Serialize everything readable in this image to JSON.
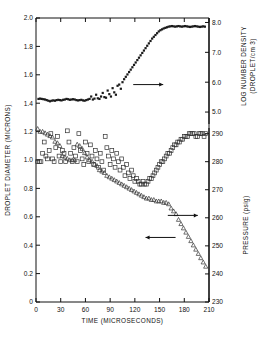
{
  "figure": {
    "background": "#ffffff",
    "ink": "#111111"
  },
  "chart_data": {
    "type": "scatter",
    "title": "",
    "xlabel": "TIME (MICROSECONDS)",
    "xlim": [
      0,
      210
    ],
    "xticks": [
      0,
      30,
      60,
      90,
      120,
      150,
      180,
      210
    ],
    "xticklabels": [
      "0",
      "30",
      "60",
      "90",
      "120",
      "150",
      "180",
      "210"
    ],
    "axes": [
      {
        "id": "left",
        "label": "DROPLET DIAMETER (MICRONS)",
        "lim": [
          0,
          2.0
        ],
        "ticks": [
          0,
          0.2,
          0.4,
          0.6,
          0.8,
          1.0,
          1.2,
          1.4,
          1.6,
          1.8,
          2.0
        ],
        "ticklabels": [
          "0",
          "0.2",
          "0.4",
          "0.6",
          "0.8",
          "1.0",
          "1.2",
          "1.4",
          "1.6",
          "1.8",
          "2.0"
        ]
      },
      {
        "id": "right-top",
        "label": "LOG NUMBER DENSITY",
        "label2": "(DROPLET/cm 3)",
        "lim": [
          4.6,
          8.15
        ],
        "ticks": [
          5.0,
          6.0,
          7.0,
          8.0
        ],
        "ticklabels": [
          "5.0",
          "6.0",
          "7.0",
          "8.0"
        ]
      },
      {
        "id": "right-bottom",
        "label": "PRESSURE (psig)",
        "lim": [
          230,
          292
        ],
        "ticks": [
          230,
          240,
          250,
          260,
          270,
          280,
          290
        ],
        "ticklabels": [
          "230",
          "240",
          "250",
          "260",
          "270",
          "280",
          "290"
        ]
      }
    ],
    "annotations": [
      {
        "name": "arrow-to-right-axis-density",
        "text": "",
        "direction": "right",
        "x": 118,
        "y": 5.92
      },
      {
        "name": "arrow-to-right-axis-pressure",
        "text": "",
        "direction": "left",
        "x": 133,
        "y": 253
      },
      {
        "name": "arrow-to-left-axis-diameter",
        "text": "",
        "direction": "right",
        "x": 160,
        "y": 0.61
      }
    ],
    "series": [
      {
        "name": "Log number density",
        "marker": "filled-square",
        "axis": "right-top",
        "color": "#1a1a1a",
        "x": [
          3,
          5,
          7,
          9,
          11,
          13,
          15,
          17,
          19,
          21,
          23,
          25,
          27,
          29,
          31,
          33,
          35,
          37,
          39,
          41,
          43,
          45,
          47,
          49,
          51,
          53,
          55,
          57,
          59,
          61,
          63,
          65,
          67,
          69,
          71,
          73,
          75,
          77,
          79,
          81,
          83,
          85,
          87,
          89,
          91,
          93,
          95,
          97,
          99,
          101,
          103,
          105,
          107,
          109,
          111,
          113,
          115,
          117,
          119,
          121,
          123,
          125,
          127,
          129,
          131,
          133,
          135,
          137,
          139,
          141,
          143,
          145,
          147,
          149,
          151,
          153,
          155,
          157,
          159,
          161,
          163,
          165,
          167,
          169,
          171,
          173,
          175,
          177,
          179,
          181,
          183,
          185,
          187,
          189,
          191,
          193,
          195,
          197,
          199,
          201,
          203,
          205
        ],
        "y": [
          5.44,
          5.45,
          5.44,
          5.43,
          5.42,
          5.4,
          5.38,
          5.36,
          5.38,
          5.39,
          5.38,
          5.4,
          5.41,
          5.4,
          5.39,
          5.41,
          5.42,
          5.44,
          5.43,
          5.41,
          5.42,
          5.43,
          5.42,
          5.4,
          5.39,
          5.4,
          5.41,
          5.39,
          5.38,
          5.4,
          5.42,
          5.44,
          5.52,
          5.42,
          5.45,
          5.58,
          5.46,
          5.44,
          5.52,
          5.64,
          5.5,
          5.48,
          5.72,
          5.6,
          5.52,
          5.8,
          5.66,
          5.58,
          5.88,
          5.92,
          5.78,
          6.0,
          6.1,
          6.18,
          6.26,
          6.34,
          6.42,
          6.5,
          6.58,
          6.66,
          6.74,
          6.82,
          6.9,
          6.98,
          7.06,
          7.14,
          7.22,
          7.3,
          7.38,
          7.46,
          7.52,
          7.58,
          7.64,
          7.7,
          7.74,
          7.77,
          7.8,
          7.82,
          7.84,
          7.86,
          7.87,
          7.88,
          7.87,
          7.86,
          7.87,
          7.88,
          7.87,
          7.86,
          7.87,
          7.88,
          7.87,
          7.86,
          7.85,
          7.86,
          7.87,
          7.88,
          7.87,
          7.86,
          7.85,
          7.86,
          7.87,
          7.86
        ]
      },
      {
        "name": "Pressure",
        "marker": "open-square",
        "axis": "right-bottom",
        "color": "#333333",
        "x": [
          2,
          4,
          6,
          8,
          10,
          12,
          14,
          16,
          18,
          20,
          22,
          24,
          26,
          28,
          30,
          32,
          34,
          36,
          38,
          40,
          42,
          44,
          46,
          48,
          50,
          52,
          54,
          56,
          58,
          60,
          62,
          64,
          66,
          68,
          70,
          72,
          74,
          76,
          78,
          80,
          82,
          84,
          86,
          88,
          90,
          92,
          94,
          96,
          98,
          100,
          102,
          104,
          106,
          108,
          110,
          112,
          114,
          116,
          118,
          120,
          122,
          124,
          126,
          128,
          130,
          132,
          134,
          136,
          138,
          140,
          142,
          144,
          146,
          148,
          150,
          152,
          154,
          156,
          158,
          160,
          162,
          164,
          166,
          168,
          170,
          172,
          174,
          176,
          178,
          180,
          182,
          184,
          186,
          188,
          190,
          192,
          194,
          196,
          198,
          200,
          202,
          204,
          206
        ],
        "y": [
          280,
          280,
          280,
          283,
          287,
          282,
          281,
          284,
          290,
          281,
          280,
          285,
          289,
          282,
          280,
          284,
          283,
          280,
          291,
          287,
          283,
          280,
          285,
          282,
          280,
          290,
          284,
          281,
          279,
          287,
          283,
          280,
          286,
          282,
          279,
          284,
          281,
          278,
          283,
          280,
          277,
          289,
          285,
          282,
          279,
          284,
          281,
          278,
          283,
          280,
          277,
          281,
          278,
          275,
          279,
          276,
          274,
          277,
          275,
          273,
          274,
          273,
          272,
          272,
          273,
          272,
          272,
          273,
          274,
          274,
          275,
          276,
          277,
          278,
          279,
          280,
          280,
          281,
          282,
          283,
          283,
          284,
          285,
          286,
          286,
          287,
          287,
          288,
          288,
          289,
          289,
          289,
          290,
          290,
          290,
          290,
          289,
          289,
          290,
          290,
          290,
          289,
          290
        ]
      },
      {
        "name": "Droplet diameter",
        "marker": "open-triangle",
        "axis": "left",
        "color": "#333333",
        "x": [
          2,
          5,
          8,
          11,
          14,
          17,
          20,
          23,
          26,
          29,
          32,
          35,
          38,
          41,
          44,
          47,
          50,
          53,
          56,
          59,
          62,
          65,
          68,
          71,
          74,
          77,
          80,
          83,
          86,
          89,
          92,
          95,
          98,
          101,
          104,
          107,
          110,
          113,
          116,
          119,
          122,
          125,
          128,
          131,
          134,
          137,
          140,
          143,
          146,
          149,
          152,
          155,
          158,
          161,
          164,
          167,
          170,
          173,
          176,
          179,
          182,
          185,
          188,
          191,
          194,
          197,
          200,
          203,
          206
        ],
        "y": [
          1.22,
          1.2,
          1.2,
          1.19,
          1.18,
          1.17,
          1.16,
          1.13,
          1.12,
          1.1,
          1.03,
          1.02,
          1.01,
          1.0,
          1.0,
          1.0,
          1.11,
          1.1,
          1.08,
          1.05,
          1.02,
          1.0,
          0.99,
          0.97,
          0.96,
          0.93,
          0.92,
          0.91,
          0.89,
          0.88,
          0.87,
          0.86,
          0.85,
          0.84,
          0.83,
          0.82,
          0.81,
          0.8,
          0.79,
          0.78,
          0.77,
          0.76,
          0.75,
          0.74,
          0.73,
          0.73,
          0.72,
          0.72,
          0.71,
          0.71,
          0.71,
          0.7,
          0.7,
          0.69,
          0.66,
          0.64,
          0.62,
          0.58,
          0.55,
          0.52,
          0.49,
          0.46,
          0.43,
          0.4,
          0.37,
          0.34,
          0.31,
          0.28,
          0.25
        ]
      }
    ]
  }
}
